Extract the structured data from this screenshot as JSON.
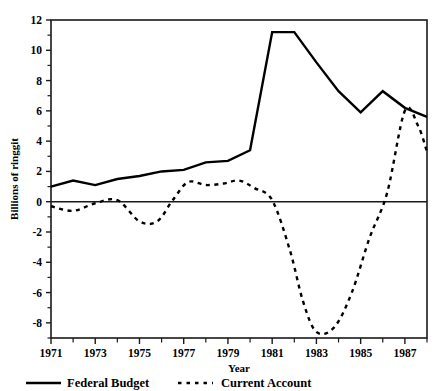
{
  "chart_data": {
    "type": "line",
    "title": "",
    "xlabel": "Year",
    "ylabel": "Billions of ringgit",
    "xlim": [
      1971,
      1988
    ],
    "ylim": [
      -9,
      12
    ],
    "ytick_values": [
      12,
      10,
      8,
      6,
      4,
      2,
      0,
      -2,
      -4,
      -6,
      -8
    ],
    "ytick_labels": [
      "12",
      "10",
      "8",
      "6",
      "4",
      "2",
      "0",
      "-2",
      "-4",
      "-6",
      "-8"
    ],
    "xtick_values": [
      1971,
      1973,
      1975,
      1977,
      1979,
      1981,
      1983,
      1985,
      1987
    ],
    "xtick_labels": [
      "1971",
      "1973",
      "1975",
      "1977",
      "1979",
      "1981",
      "1983",
      "1985",
      "1987"
    ],
    "minor_xticks": [
      1972,
      1974,
      1976,
      1978,
      1980,
      1982,
      1984,
      1986,
      1988
    ],
    "grid": false,
    "zero_line": true,
    "legend_position": "below",
    "x": [
      1971,
      1972,
      1973,
      1974,
      1975,
      1976,
      1977,
      1978,
      1979,
      1980,
      1981,
      1982,
      1983,
      1984,
      1985,
      1986,
      1987,
      1988
    ],
    "series": [
      {
        "name": "Federal Budget",
        "style": "solid",
        "color": "#000000",
        "values": [
          1.0,
          1.4,
          1.1,
          1.5,
          1.7,
          2.0,
          2.1,
          2.6,
          2.7,
          3.4,
          11.2,
          11.2,
          9.2,
          7.3,
          5.9,
          7.3,
          6.2,
          5.6
        ]
      },
      {
        "name": "Current Account",
        "style": "dashed",
        "color": "#000000",
        "values": [
          -0.3,
          -0.6,
          -0.1,
          0.1,
          -1.3,
          -1.3,
          0.1,
          1.3,
          1.2,
          0.7,
          0.9,
          1.4,
          0.1,
          -3.2,
          -6.6,
          -8.6,
          -8.3,
          -6.0
        ]
      }
    ],
    "series_current_account_x": [
      1971,
      1972,
      1973,
      1974,
      1975,
      1975.8,
      1976.5,
      1977.2,
      1978,
      1978.8,
      1979.5,
      1980.2,
      1981,
      1981.8,
      1982.4,
      1983,
      1983.8,
      1984.6,
      1985.4,
      1986.2,
      1987,
      1987.6,
      1988
    ],
    "series_current_account_y": [
      -0.3,
      -0.6,
      -0.1,
      0.1,
      -1.3,
      -1.3,
      0.1,
      1.3,
      1.1,
      1.2,
      1.4,
      0.9,
      0.1,
      -3.2,
      -6.6,
      -8.6,
      -8.3,
      -6.0,
      -2.4,
      0.6,
      6.0,
      5.0,
      3.3
    ]
  },
  "legend": {
    "items": [
      {
        "label": "Federal Budget",
        "style": "solid"
      },
      {
        "label": "Current Account",
        "style": "dashed"
      }
    ]
  }
}
